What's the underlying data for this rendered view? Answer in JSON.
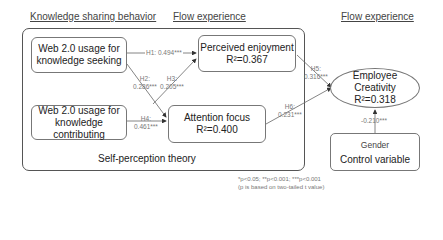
{
  "headers": {
    "knowledge_sharing": "Knowledge sharing behavior",
    "flow_left": "Flow experience",
    "flow_right": "Flow experience"
  },
  "nodes": {
    "seeking": {
      "line1": "Web 2.0 usage for",
      "line2": "knowledge seeking"
    },
    "contributing": {
      "line1": "Web 2.0 usage for",
      "line2": "knowledge contributing"
    },
    "enjoyment": {
      "line1": "Perceived enjoyment",
      "line2": "R²=0.367"
    },
    "attention": {
      "line1": "Attention focus",
      "line2": "R²=0.400"
    },
    "creativity": {
      "line1": "Employee Creativity",
      "line2": "R²=0.318"
    },
    "gender": {
      "line1": "Gender",
      "line2": "Control variable"
    }
  },
  "paths": {
    "h1": "H1: 0.494***",
    "h2_label": "H2:",
    "h2_value": "0.286***",
    "h3_label": "H3:",
    "h3_value": "0.205***",
    "h4_label": "H4:",
    "h4_value": "0.461***",
    "h5_label": "H5:",
    "h5_value": "0.316***",
    "h6_label": "H6:",
    "h6_value": "0.231***",
    "gender_value": "-0.210***"
  },
  "frame_label": "Self-perception theory",
  "notes": {
    "line1": "*p<0.05; **p<0.001; ***p<0.001",
    "line2": "(p is based on two-tailed t value)"
  },
  "colors": {
    "line": "#555555",
    "border": "#777777",
    "label": "#777777"
  }
}
